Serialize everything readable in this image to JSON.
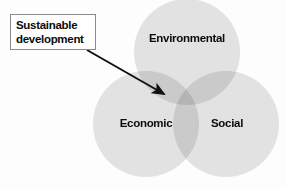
{
  "diagram": {
    "background_color": "#fdfdfd",
    "callout": {
      "label": "Sustainable\ndevelopment",
      "line1": "Sustainable",
      "line2": "development",
      "border_color": "#8a8a8a",
      "fill_color": "#ffffff",
      "text_color": "#0b0b0b"
    },
    "arrow": {
      "name": "callout-arrow",
      "color": "#111111",
      "start_x": 87,
      "start_y": 50,
      "end_x": 168,
      "end_y": 96,
      "points_to": "overlap-environmental-economic"
    },
    "circles": [
      {
        "id": "environmental",
        "label": "Environmental",
        "cx": 187,
        "cy": 52,
        "r": 53,
        "fill": "#dedede"
      },
      {
        "id": "economic",
        "label": "Economic",
        "cx": 146,
        "cy": 124,
        "r": 53,
        "fill": "#dedede"
      },
      {
        "id": "social",
        "label": "Social",
        "cx": 226,
        "cy": 124,
        "r": 53,
        "fill": "#dedede"
      }
    ],
    "colors": {
      "circle_fill": "#dedede",
      "overlap_fill": "#c3c3c3",
      "center_fill": "#b4b4b4",
      "text": "#0b0b0b",
      "arrow": "#111111"
    }
  }
}
